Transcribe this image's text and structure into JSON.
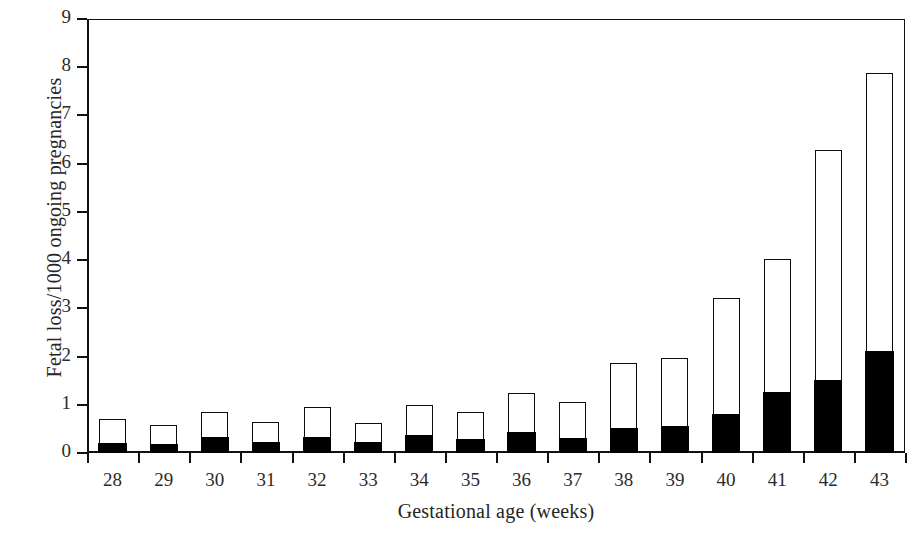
{
  "chart_data": {
    "type": "bar",
    "title": "",
    "subtitle": "",
    "xlabel": "Gestational age (weeks)",
    "ylabel": "Fetal loss/1000 ongoing pregnancies",
    "categories": [
      "28",
      "29",
      "30",
      "31",
      "32",
      "33",
      "34",
      "35",
      "36",
      "37",
      "38",
      "39",
      "40",
      "41",
      "42",
      "43"
    ],
    "ylim": [
      0,
      9
    ],
    "yticks": [
      "0",
      "1",
      "2",
      "3",
      "4",
      "5",
      "6",
      "7",
      "8",
      "9"
    ],
    "ytick_values": [
      0,
      1,
      2,
      3,
      4,
      5,
      6,
      7,
      8,
      9
    ],
    "grid": false,
    "legend": "none",
    "stacked": true,
    "series": [
      {
        "name": "lower-segment",
        "color": "#000000",
        "values": [
          0.2,
          0.18,
          0.33,
          0.22,
          0.33,
          0.23,
          0.37,
          0.28,
          0.42,
          0.31,
          0.5,
          0.56,
          0.8,
          1.25,
          1.5,
          2.1
        ]
      },
      {
        "name": "upper-segment",
        "color": "#ffffff",
        "values": [
          0.48,
          0.38,
          0.51,
          0.4,
          0.6,
          0.37,
          0.6,
          0.54,
          0.8,
          0.72,
          1.35,
          1.39,
          2.4,
          2.75,
          4.77,
          5.75
        ]
      }
    ],
    "totals": [
      0.68,
      0.56,
      0.84,
      0.62,
      0.93,
      0.6,
      0.97,
      0.82,
      1.22,
      1.03,
      1.85,
      1.95,
      3.2,
      4.0,
      6.27,
      7.85
    ]
  },
  "axes": {
    "line_color": "#111111",
    "bar_edge_color": "#0d0d0d",
    "background": "#ffffff"
  }
}
